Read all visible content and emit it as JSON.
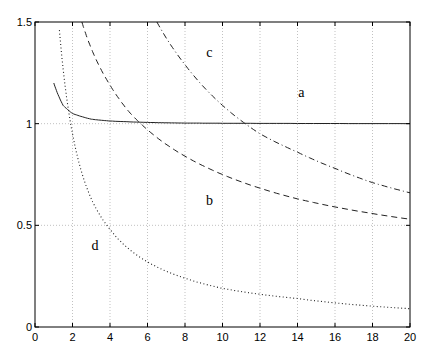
{
  "chart_data": {
    "type": "line",
    "title": "",
    "xlabel": "",
    "ylabel": "",
    "xlim": [
      0,
      20
    ],
    "ylim": [
      0,
      1.5
    ],
    "grid": true,
    "xticks": [
      "0",
      "2",
      "4",
      "6",
      "8",
      "10",
      "12",
      "14",
      "16",
      "18",
      "20"
    ],
    "yticks": [
      "0",
      "0.5",
      "1",
      "1.5"
    ],
    "series": [
      {
        "name": "a",
        "style": "solid",
        "x": [
          1,
          1.5,
          2,
          3,
          4,
          6,
          8,
          10,
          14,
          20
        ],
        "values": [
          1.2,
          1.09,
          1.05,
          1.022,
          1.013,
          1.006,
          1.003,
          1.002,
          1.001,
          1.0
        ]
      },
      {
        "name": "b",
        "style": "dashed",
        "x": [
          2.5,
          3,
          4,
          5,
          6,
          8,
          10,
          14,
          20
        ],
        "values": [
          1.5,
          1.37,
          1.19,
          1.06,
          0.97,
          0.84,
          0.75,
          0.63,
          0.53
        ]
      },
      {
        "name": "c",
        "style": "dashdot",
        "x": [
          6.5,
          8,
          10,
          12,
          14,
          16,
          18,
          20
        ],
        "values": [
          1.5,
          1.29,
          1.09,
          0.95,
          0.86,
          0.78,
          0.71,
          0.66
        ]
      },
      {
        "name": "d",
        "style": "dotted",
        "x": [
          1.3,
          1.5,
          2,
          3,
          4,
          6,
          8,
          10,
          14,
          20
        ],
        "values": [
          1.46,
          1.27,
          0.95,
          0.63,
          0.48,
          0.32,
          0.24,
          0.19,
          0.14,
          0.09
        ]
      }
    ],
    "annotations": [
      {
        "text": "a",
        "x": 14.2,
        "y": 1.13
      },
      {
        "text": "b",
        "x": 9.3,
        "y": 0.6
      },
      {
        "text": "c",
        "x": 9.3,
        "y": 1.33
      },
      {
        "text": "d",
        "x": 3.2,
        "y": 0.38
      }
    ]
  }
}
